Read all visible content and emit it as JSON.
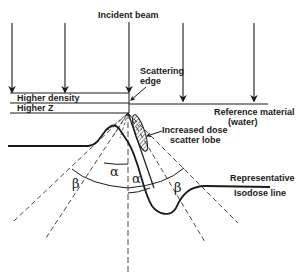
{
  "diagram": {
    "title": "Incident beam",
    "labels": {
      "incident_beam": "Incident beam",
      "scattering_edge_1": "Scattering",
      "scattering_edge_2": "edge",
      "higher_density": "Higher density",
      "higher_z": "Higher Z",
      "reference_1": "Reference material",
      "reference_2": "(water)",
      "scatter_lobe_1": "Increased dose",
      "scatter_lobe_2": "scatter lobe",
      "isodose_1": "Representative",
      "isodose_2": "Isodose line"
    },
    "angles": {
      "alpha": "α",
      "beta": "β"
    },
    "colors": {
      "ink": "#1a1a1a",
      "background": "#ffffff"
    }
  }
}
